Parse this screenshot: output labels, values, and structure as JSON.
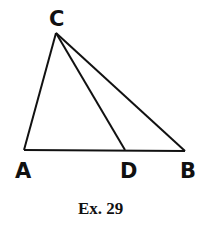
{
  "figure": {
    "caption": "Ex. 29",
    "points": {
      "A": {
        "label": "A",
        "x": 24,
        "y": 150
      },
      "B": {
        "label": "B",
        "x": 185,
        "y": 151
      },
      "C": {
        "label": "C",
        "x": 56,
        "y": 33
      },
      "D": {
        "label": "D",
        "x": 125,
        "y": 150
      }
    },
    "segments": [
      "CA",
      "CB",
      "CD",
      "AB"
    ],
    "stroke_color": "#111111"
  }
}
